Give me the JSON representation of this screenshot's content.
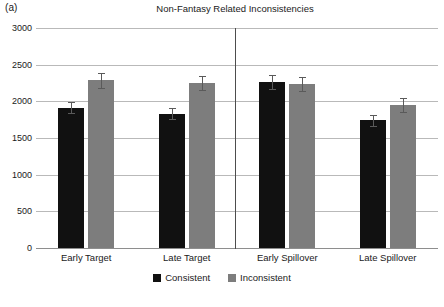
{
  "panel": {
    "label": "(a)"
  },
  "chart_data": {
    "type": "bar",
    "title": "Non-Fantasy Related Inconsistencies",
    "xlabel": "",
    "ylabel": "",
    "ylim": [
      0,
      3000
    ],
    "ytick_step": 500,
    "yticks": [
      3000,
      2500,
      2000,
      1500,
      1000,
      500,
      0
    ],
    "ytick_labels": [
      "3000",
      "2500",
      "2000",
      "1500",
      "1000",
      "500",
      "0"
    ],
    "grid": true,
    "legend_position": "bottom-center",
    "categories": [
      "Early Target",
      "Late Target",
      "Early Spillover",
      "Late Spillover"
    ],
    "group_divider_after_category_index": 1,
    "series": [
      {
        "name": "Consistent",
        "color": "#111111",
        "values": [
          1910,
          1830,
          2265,
          1745
        ],
        "errors": [
          75,
          75,
          100,
          75
        ]
      },
      {
        "name": "Inconsistent",
        "color": "#7d7d7d",
        "values": [
          2285,
          2250,
          2235,
          1950
        ],
        "errors": [
          100,
          95,
          100,
          95
        ]
      }
    ],
    "legend": [
      "Consistent",
      "Inconsistent"
    ]
  }
}
